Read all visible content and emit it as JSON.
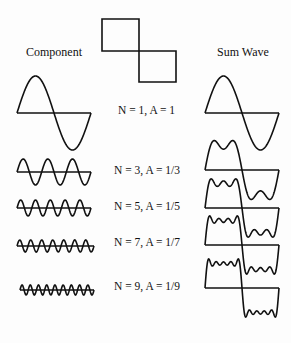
{
  "headers": {
    "component": "Component",
    "sum": "Sum Wave"
  },
  "target_wave": "square-wave",
  "terms": [
    {
      "n": 1,
      "label": "N = 1, A = 1"
    },
    {
      "n": 3,
      "label": "N = 3, A = 1/3"
    },
    {
      "n": 5,
      "label": "N = 5, A = 1/5"
    },
    {
      "n": 7,
      "label": "N = 7, A = 1/7"
    },
    {
      "n": 9,
      "label": "N = 9, A = 1/9"
    }
  ],
  "colors": {
    "stroke": "#111111",
    "background": "#fdfdfd"
  }
}
